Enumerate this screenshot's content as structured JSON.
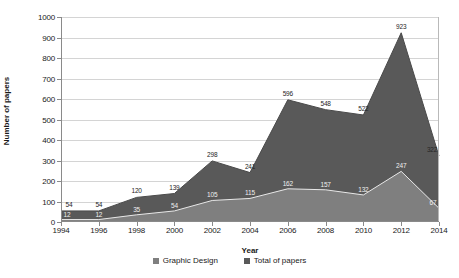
{
  "chart_data": {
    "type": "area",
    "title": "",
    "xlabel": "Year",
    "ylabel": "Number of papers",
    "categories": [
      "1994",
      "1996",
      "1998",
      "2000",
      "2002",
      "2004",
      "2006",
      "2008",
      "2010",
      "2012",
      "2014"
    ],
    "x": [
      1994,
      1996,
      1998,
      2000,
      2002,
      2004,
      2006,
      2008,
      2010,
      2012,
      2014
    ],
    "ylim": [
      0,
      1000
    ],
    "yticks": [
      0,
      100,
      200,
      300,
      400,
      500,
      600,
      700,
      800,
      900,
      1000
    ],
    "grid": true,
    "legend_position": "bottom",
    "series": [
      {
        "name": "Total of papers",
        "values": [
          54,
          54,
          120,
          139,
          298,
          241,
          596,
          548,
          522,
          923,
          322
        ],
        "color": "#595959",
        "label_color": "#262626"
      },
      {
        "name": "Graphic Design",
        "values": [
          12,
          12,
          35,
          54,
          105,
          115,
          162,
          157,
          132,
          247,
          67
        ],
        "color": "#7f7f7f",
        "label_color": "#efefef"
      }
    ],
    "data_labels": {
      "total": [
        "54",
        "54",
        "120",
        "139",
        "298",
        "241",
        "596",
        "548",
        "522",
        "923",
        "322"
      ],
      "graphic_design": [
        "12",
        "12",
        "35",
        "54",
        "105",
        "115",
        "162",
        "157",
        "132",
        "247",
        "67"
      ]
    }
  },
  "legend": {
    "items": [
      {
        "label": "Graphic Design",
        "color": "#7f7f7f"
      },
      {
        "label": "Total of papers",
        "color": "#595959"
      }
    ]
  },
  "axes": {
    "y_title": "Number of papers",
    "x_title": "Year",
    "y_tick_labels": [
      "0",
      "100",
      "200",
      "300",
      "400",
      "500",
      "600",
      "700",
      "800",
      "900",
      "1000"
    ],
    "x_tick_labels": [
      "1994",
      "1996",
      "1998",
      "2000",
      "2002",
      "2004",
      "2006",
      "2008",
      "2010",
      "2012",
      "2014"
    ]
  }
}
